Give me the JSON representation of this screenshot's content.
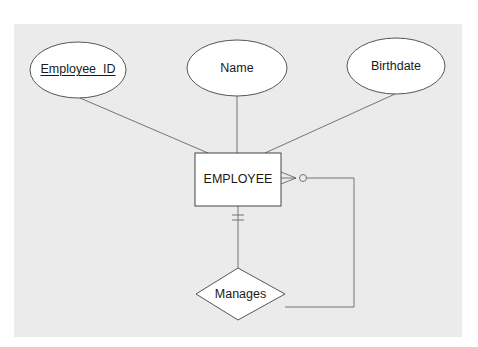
{
  "diagram": {
    "type": "ER diagram (Crow's foot notation, unary relationship)",
    "entity": {
      "name": "EMPLOYEE"
    },
    "attributes": [
      {
        "name": "Employee_ID",
        "primary_key": true
      },
      {
        "name": "Name",
        "primary_key": false
      },
      {
        "name": "Birthdate",
        "primary_key": false
      }
    ],
    "relationship": {
      "name": "Manages",
      "cardinality_manager_side": "mandatory one",
      "cardinality_subordinate_side": "optional many"
    },
    "colors": {
      "background": "#ebebeb",
      "shape_fill": "#ffffff",
      "line": "#555555"
    }
  }
}
